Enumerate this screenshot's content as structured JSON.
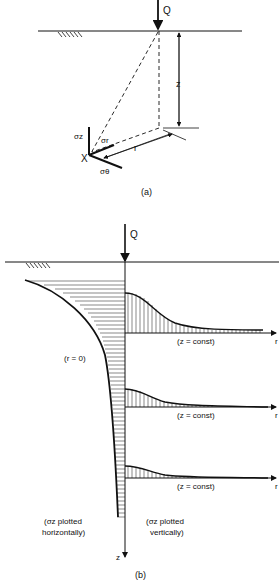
{
  "figure_a": {
    "load_label": "Q",
    "depth_label": "z",
    "radius_label": "r",
    "point_label": "X",
    "stress_z": "σz",
    "stress_r": "σr",
    "stress_theta": "σθ",
    "caption": "(a)"
  },
  "figure_b": {
    "load_label": "Q",
    "r0_label": "(r = 0)",
    "zconst_labels": [
      "(z = const)",
      "(z = const)",
      "(z = const)"
    ],
    "r_axis_labels": [
      "r",
      "r",
      "r"
    ],
    "z_axis_label": "z",
    "left_note_line1": "(σz plotted",
    "left_note_line2": "horizontally)",
    "right_note_line1": "(σz plotted",
    "right_note_line2": "vertically)",
    "caption": "(b)"
  },
  "colors": {
    "ink": "#111111",
    "background": "#ffffff"
  }
}
